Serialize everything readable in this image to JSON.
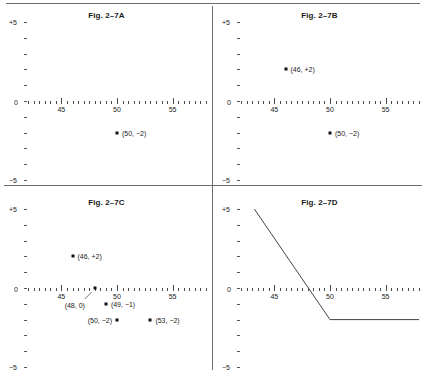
{
  "chart_data": [
    {
      "type": "scatter",
      "title": "Fig. 2–7A",
      "xlabel": "",
      "ylabel": "",
      "xlim": [
        42,
        58
      ],
      "ylim": [
        -5,
        5
      ],
      "xticks": [
        45,
        50,
        55
      ],
      "yticks": [
        "+5",
        "0",
        "−5"
      ],
      "grid": false,
      "points": [
        {
          "x": 50,
          "y": -2,
          "label": "(50, −2)",
          "label_side": "right"
        }
      ]
    },
    {
      "type": "scatter",
      "title": "Fig. 2–7B",
      "xlabel": "",
      "ylabel": "",
      "xlim": [
        42,
        58
      ],
      "ylim": [
        -5,
        5
      ],
      "xticks": [
        45,
        50,
        55
      ],
      "yticks": [
        "+5",
        "0",
        "−5"
      ],
      "grid": false,
      "points": [
        {
          "x": 46,
          "y": 2,
          "label": "(46, +2)",
          "label_side": "right"
        },
        {
          "x": 50,
          "y": -2,
          "label": "(50, −2)",
          "label_side": "right"
        }
      ]
    },
    {
      "type": "scatter",
      "title": "Fig. 2–7C",
      "xlabel": "",
      "ylabel": "",
      "xlim": [
        42,
        58
      ],
      "ylim": [
        -5,
        5
      ],
      "xticks": [
        45,
        50,
        55
      ],
      "yticks": [
        "+5",
        "0",
        "−5"
      ],
      "grid": false,
      "points": [
        {
          "x": 46,
          "y": 2,
          "label": "(46, +2)",
          "label_side": "right"
        },
        {
          "x": 48,
          "y": 0,
          "label": "(48, 0)",
          "label_side": "leader"
        },
        {
          "x": 49,
          "y": -1,
          "label": "(49, −1)",
          "label_side": "right"
        },
        {
          "x": 50,
          "y": -2,
          "label": "(50, −2)",
          "label_side": "left"
        },
        {
          "x": 53,
          "y": -2,
          "label": "(53, −2)",
          "label_side": "right"
        }
      ]
    },
    {
      "type": "line",
      "title": "Fig. 2–7D",
      "xlabel": "",
      "ylabel": "",
      "xlim": [
        42,
        58
      ],
      "ylim": [
        -5,
        5
      ],
      "xticks": [
        45,
        50,
        55
      ],
      "yticks": [
        "+5",
        "0",
        "−5"
      ],
      "grid": false,
      "series": [
        {
          "name": "response-curve",
          "x": [
            43.2,
            50,
            58
          ],
          "y": [
            5,
            -2,
            -2
          ]
        }
      ]
    }
  ],
  "panels": [
    {
      "id": "a",
      "title": "Fig. 2–7A"
    },
    {
      "id": "b",
      "title": "Fig. 2–7B"
    },
    {
      "id": "c",
      "title": "Fig. 2–7C"
    },
    {
      "id": "d",
      "title": "Fig. 2–7D"
    }
  ],
  "axis": {
    "y_top_label": "+5",
    "y_zero_label": "0",
    "y_bottom_label": "−5",
    "x_tick_labels": [
      "45",
      "50",
      "55"
    ]
  }
}
